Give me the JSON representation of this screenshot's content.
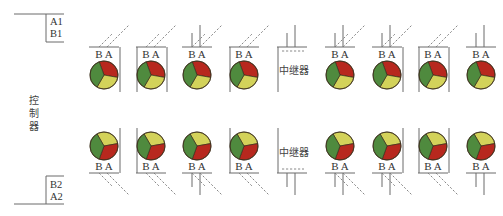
{
  "controller": {
    "label_chars": [
      "控",
      "制",
      "器"
    ]
  },
  "bus": {
    "top_labels": [
      "A1",
      "B1"
    ],
    "bottom_labels": [
      "B2",
      "A2"
    ]
  },
  "colors": {
    "red": "#b7281e",
    "green": "#4f8a3e",
    "yellow": "#d3d25a",
    "outline": "#3b2e1a",
    "line": "#6a6a6a"
  },
  "unit_terminal_label": "B A",
  "repeater_label": "中继器",
  "top_row": [
    {
      "x": 105,
      "type": "light",
      "frame": "right",
      "wires": "dashed"
    },
    {
      "x": 152,
      "type": "light",
      "frame": "box",
      "wires": "dashed"
    },
    {
      "x": 198,
      "type": "light",
      "frame": "none",
      "wires": "mixed"
    },
    {
      "x": 245,
      "type": "light",
      "frame": "left",
      "wires": "dashed"
    },
    {
      "x": 293,
      "type": "repeater",
      "frame": "left",
      "wires": "solid"
    },
    {
      "x": 341,
      "type": "light",
      "frame": "none",
      "wires": "mixed"
    },
    {
      "x": 388,
      "type": "light",
      "frame": "right",
      "wires": "mixed"
    },
    {
      "x": 434,
      "type": "light",
      "frame": "box",
      "wires": "dashed"
    },
    {
      "x": 482,
      "type": "light",
      "frame": "none",
      "wires": "solid"
    }
  ],
  "bottom_row": [
    {
      "x": 105,
      "type": "light",
      "frame": "right",
      "wires": "dashed"
    },
    {
      "x": 152,
      "type": "light",
      "frame": "left",
      "wires": "dashed"
    },
    {
      "x": 198,
      "type": "light",
      "frame": "none",
      "wires": "mixed"
    },
    {
      "x": 245,
      "type": "light",
      "frame": "left",
      "wires": "dashed"
    },
    {
      "x": 293,
      "type": "repeater",
      "frame": "left",
      "wires": "solid"
    },
    {
      "x": 341,
      "type": "light",
      "frame": "none",
      "wires": "mixed"
    },
    {
      "x": 388,
      "type": "light",
      "frame": "right",
      "wires": "mixed"
    },
    {
      "x": 434,
      "type": "light",
      "frame": "box",
      "wires": "dashed"
    },
    {
      "x": 482,
      "type": "light",
      "frame": "none",
      "wires": "solid"
    }
  ]
}
